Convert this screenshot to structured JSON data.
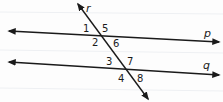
{
  "diagram": {
    "colors": {
      "stroke": "#1a1a1a",
      "background": "#fdfdfd"
    },
    "lines": [
      {
        "id": "p",
        "label": "p",
        "role": "parallel"
      },
      {
        "id": "q",
        "label": "q",
        "role": "parallel"
      },
      {
        "id": "r",
        "label": "r",
        "role": "transversal"
      }
    ],
    "angles": [
      {
        "label": "1",
        "position": "upper-left at p"
      },
      {
        "label": "5",
        "position": "upper-right at p"
      },
      {
        "label": "2",
        "position": "lower-left at p"
      },
      {
        "label": "6",
        "position": "lower-right at p"
      },
      {
        "label": "3",
        "position": "upper-left at q"
      },
      {
        "label": "7",
        "position": "upper-right at q"
      },
      {
        "label": "4",
        "position": "lower-left at q"
      },
      {
        "label": "8",
        "position": "lower-right at q"
      }
    ]
  }
}
